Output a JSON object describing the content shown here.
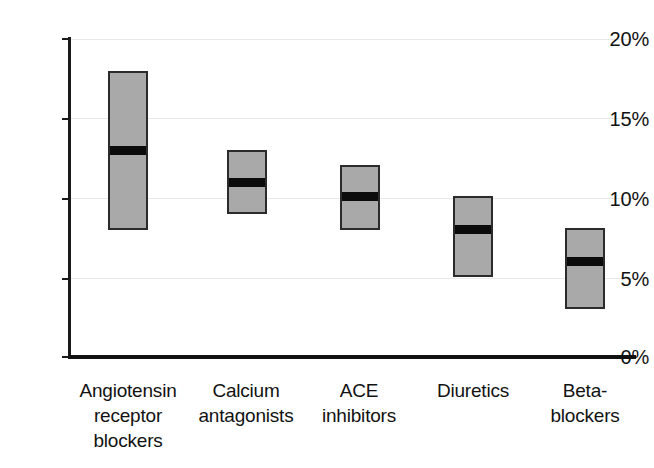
{
  "chart_data": {
    "type": "bar",
    "subtype": "floating-range-bar-with-median",
    "title": "",
    "subtitle": "",
    "xlabel": "",
    "ylabel": "",
    "categories": [
      "Angiotensin receptor blockers",
      "Calcium antagonists",
      "ACE inhibitors",
      "Diuretics",
      "Beta-blockers"
    ],
    "category_label_lines": [
      [
        "Angiotensin",
        "receptor",
        "blockers"
      ],
      [
        "Calcium",
        "antagonists"
      ],
      [
        "ACE",
        "inhibitors"
      ],
      [
        "Diuretics"
      ],
      [
        "Beta-",
        "blockers"
      ]
    ],
    "series": [
      {
        "name": "range low",
        "values": [
          8.0,
          9.0,
          8.0,
          5.0,
          3.0
        ]
      },
      {
        "name": "range high",
        "values": [
          18.0,
          13.0,
          12.1,
          10.1,
          8.1
        ]
      },
      {
        "name": "median",
        "values": [
          13.0,
          11.0,
          10.1,
          8.0,
          6.0
        ]
      }
    ],
    "points": [
      {
        "category": "Angiotensin receptor blockers",
        "low": 8.0,
        "median": 13.0,
        "high": 18.0
      },
      {
        "category": "Calcium antagonists",
        "low": 9.0,
        "median": 11.0,
        "high": 13.0
      },
      {
        "category": "ACE inhibitors",
        "low": 8.0,
        "median": 10.1,
        "high": 12.1
      },
      {
        "category": "Diuretics",
        "low": 5.0,
        "median": 8.0,
        "high": 10.1
      },
      {
        "category": "Beta-blockers",
        "low": 3.0,
        "median": 6.0,
        "high": 8.1
      }
    ],
    "ylim": [
      0,
      20
    ],
    "yticks": [
      0,
      5,
      10,
      15,
      20
    ],
    "ytick_labels": [
      "0%",
      "5%",
      "10%",
      "15%",
      "20%"
    ],
    "grid": true,
    "grid_axis": "y",
    "legend": false,
    "legend_position": "none",
    "units": "percent",
    "colors": {
      "bar_fill": "#a9a9a9",
      "bar_border": "#2b2b2b",
      "median_band": "#0b0b0b",
      "gridline": "#e9e9e9",
      "axis": "#111111",
      "text": "#121212",
      "background": "#ffffff"
    }
  },
  "axis": {
    "y_labels": [
      "20%",
      "15%",
      "10%",
      "5%",
      "0%"
    ]
  }
}
